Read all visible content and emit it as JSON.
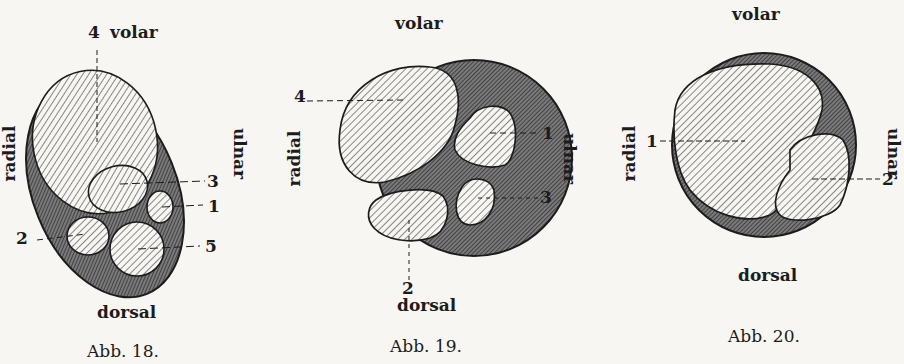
{
  "figures": [
    {
      "caption": "Abb. 18.",
      "orientation": {
        "top": "volar",
        "bottom": "dorsal",
        "left": "radial",
        "right": "ulnar"
      },
      "labels": [
        "4",
        "3",
        "1",
        "2",
        "5"
      ]
    },
    {
      "caption": "Abb. 19.",
      "orientation": {
        "top": "volar",
        "bottom": "dorsal",
        "left": "radial",
        "right": "ulnar"
      },
      "labels": [
        "4",
        "1",
        "3",
        "2"
      ]
    },
    {
      "caption": "Abb. 20.",
      "orientation": {
        "top": "volar",
        "bottom": "dorsal",
        "left": "radial",
        "right": "ulnar"
      },
      "labels": [
        "1",
        "2"
      ]
    }
  ],
  "colors": {
    "background": "#f7f6f2",
    "ink": "#1c1c1c",
    "dark_hatch": "#4a4a4a"
  }
}
